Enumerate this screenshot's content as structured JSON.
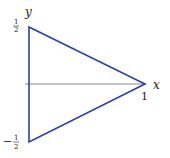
{
  "diagram": {
    "axis_labels": {
      "x": "x",
      "y": "y"
    },
    "ticks": {
      "x_one": "1",
      "y_top_num": "1",
      "y_top_den": "2",
      "y_bot_sign": "−",
      "y_bot_num": "1",
      "y_bot_den": "2"
    },
    "shape": "triangle",
    "vertices": [
      [
        0,
        0.5
      ],
      [
        0,
        -0.5
      ],
      [
        1,
        0
      ]
    ],
    "colors": {
      "triangle": "#2b3fa8",
      "axis": "#888888"
    }
  }
}
